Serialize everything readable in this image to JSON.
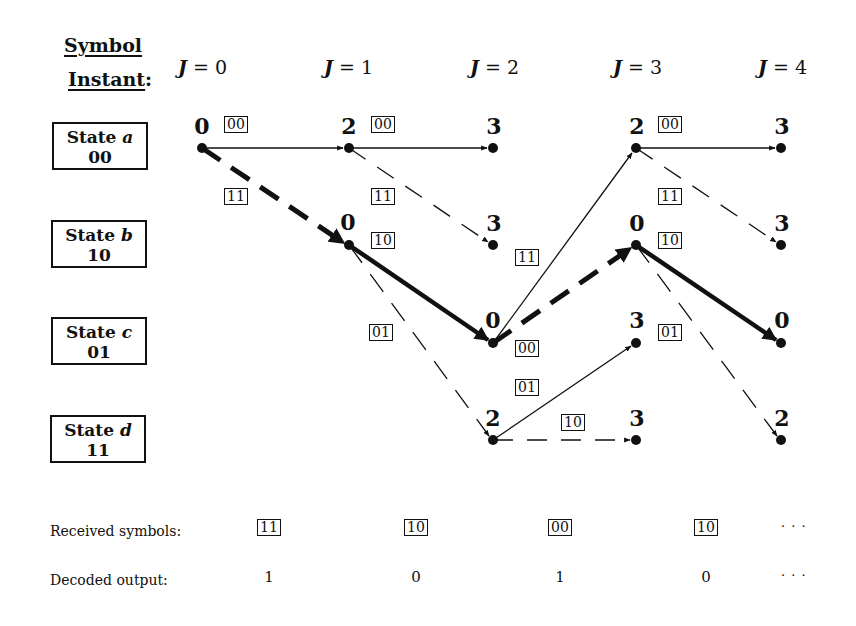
{
  "header": {
    "symbol_label": "Symbol",
    "instant_label": "Instant",
    "colon": ":",
    "instants": [
      {
        "var": "J",
        "eq": " = ",
        "val": "0"
      },
      {
        "var": "J",
        "eq": " = ",
        "val": "1"
      },
      {
        "var": "J",
        "eq": " = ",
        "val": "2"
      },
      {
        "var": "J",
        "eq": " = ",
        "val": "3"
      },
      {
        "var": "J",
        "eq": " = ",
        "val": "4"
      }
    ]
  },
  "states": [
    {
      "prefix": "State ",
      "name": "a",
      "bits": "00"
    },
    {
      "prefix": "State ",
      "name": "b",
      "bits": "10"
    },
    {
      "prefix": "State ",
      "name": "c",
      "bits": "01"
    },
    {
      "prefix": "State ",
      "name": "d",
      "bits": "11"
    }
  ],
  "path_metrics": {
    "j0": {
      "a": "0"
    },
    "j1": {
      "a": "2",
      "b": "0"
    },
    "j2": {
      "a": "3",
      "b": "3",
      "c": "0",
      "d": "2"
    },
    "j3": {
      "a": "2",
      "b": "0",
      "c": "3",
      "d": "3"
    },
    "j4": {
      "a": "3",
      "b": "3",
      "c": "0",
      "d": "2"
    }
  },
  "branch_labels": {
    "j0_a_to_a": "00",
    "j0_a_to_b": "11",
    "j1_a_to_a": "00",
    "j1_a_to_b": "11",
    "j1_b_to_c": "10",
    "j1_b_to_d": "01",
    "j2_c_to_a": "11",
    "j2_c_to_b": "00",
    "j2_d_to_c": "01",
    "j2_d_to_d": "10",
    "j3_a_to_a": "00",
    "j3_a_to_b": "11",
    "j3_b_to_c": "10",
    "j3_b_to_d": "01"
  },
  "received": {
    "label": "Received symbols:",
    "symbols": [
      "11",
      "10",
      "00",
      "10"
    ],
    "ellipsis": "· · ·"
  },
  "decoded": {
    "label": "Decoded output:",
    "bits": [
      "1",
      "0",
      "1",
      "0"
    ],
    "ellipsis": "· · ·"
  },
  "colors": {
    "ink": "#111111",
    "background": "#ffffff"
  }
}
